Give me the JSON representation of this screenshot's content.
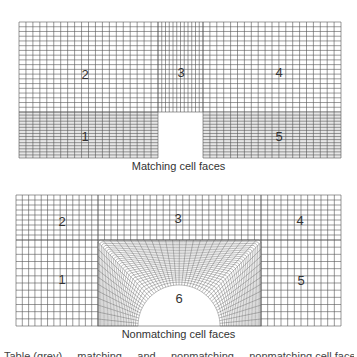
{
  "figures": [
    {
      "id": "matching",
      "caption": "Matching cell faces",
      "blocks": [
        {
          "label": "1",
          "x": 19,
          "y": 112,
          "w": 139,
          "h": 46,
          "nx": 20,
          "ny": 15,
          "shade": "#e6e6e6"
        },
        {
          "label": "2",
          "x": 19,
          "y": 22,
          "w": 139,
          "h": 90,
          "nx": 20,
          "ny": 19
        },
        {
          "label": "3",
          "x": 158,
          "y": 22,
          "w": 45,
          "h": 90,
          "nx": 12,
          "ny": 19
        },
        {
          "label": "4",
          "x": 203,
          "y": 22,
          "w": 138,
          "h": 90,
          "nx": 20,
          "ny": 19
        },
        {
          "label": "5",
          "x": 203,
          "y": 112,
          "w": 138,
          "h": 46,
          "nx": 20,
          "ny": 15,
          "shade": "#e6e6e6"
        }
      ],
      "labels": [
        {
          "text": "2",
          "x": 85,
          "y": 74
        },
        {
          "text": "3",
          "x": 181,
          "y": 72
        },
        {
          "text": "4",
          "x": 279,
          "y": 72
        },
        {
          "text": "1",
          "x": 85,
          "y": 136
        },
        {
          "text": "5",
          "x": 279,
          "y": 136
        }
      ],
      "caption_y": 166
    },
    {
      "id": "nonmatching",
      "caption": "Nonmatching cell faces",
      "blocks": [
        {
          "label": "2",
          "x": 16,
          "y": 195,
          "w": 82,
          "h": 45,
          "nx": 13,
          "ny": 9
        },
        {
          "label": "3",
          "x": 98,
          "y": 195,
          "w": 163,
          "h": 45,
          "nx": 25,
          "ny": 9
        },
        {
          "label": "4",
          "x": 261,
          "y": 195,
          "w": 80,
          "h": 45,
          "nx": 12,
          "ny": 9
        },
        {
          "label": "1",
          "x": 16,
          "y": 240,
          "w": 82,
          "h": 86,
          "nx": 13,
          "ny": 12
        },
        {
          "label": "5",
          "x": 261,
          "y": 240,
          "w": 80,
          "h": 86,
          "nx": 12,
          "ny": 12
        }
      ],
      "curved_block": {
        "label": "6",
        "x": 98,
        "y": 240,
        "w": 163,
        "h": 86,
        "cx": 179,
        "cy": 326,
        "r": 41,
        "nx": 48,
        "ny": 26
      },
      "labels": [
        {
          "text": "2",
          "x": 62,
          "y": 221
        },
        {
          "text": "3",
          "x": 178,
          "y": 218
        },
        {
          "text": "4",
          "x": 300,
          "y": 220
        },
        {
          "text": "1",
          "x": 62,
          "y": 279
        },
        {
          "text": "5",
          "x": 301,
          "y": 280
        },
        {
          "text": "6",
          "x": 179,
          "y": 298
        }
      ],
      "caption_y": 333
    }
  ],
  "cut_text": "Table (grey) ... matching ... and ... nonmatching ... nonmatching cell faces",
  "colors": {
    "line": "#555555",
    "fine_line": "#6a6a6a",
    "shade": "#e6e6e6"
  }
}
